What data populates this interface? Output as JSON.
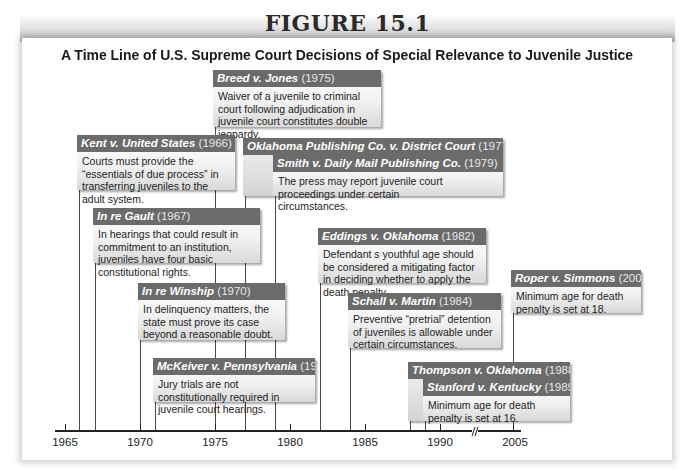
{
  "figure_label": "FIGURE 15.1",
  "title": "A Time Line of U.S. Supreme Court Decisions of Special Relevance to Juvenile Justice",
  "axis": {
    "ticks": [
      "1965",
      "1970",
      "1975",
      "1980",
      "1985",
      "1990",
      "2005"
    ],
    "break_between": [
      "1990",
      "2005"
    ]
  },
  "decisions": [
    {
      "case": "Kent v. United States",
      "year": "(1966)",
      "text": "Courts must provide the “essentials of due process” in transferring juveniles to the adult system."
    },
    {
      "case": "In re Gault",
      "year": "(1967)",
      "text": "In hearings that could result in commitment to an institution, juveniles have four basic constitutional rights."
    },
    {
      "case": "In re Winship",
      "year": "(1970)",
      "text": "In delinquency matters, the state must prove its case beyond a reasonable doubt."
    },
    {
      "case": "McKeiver v. Pennsylvania",
      "year": "(1971)",
      "text": "Jury trials are not constitutionally required in juvenile court hearings."
    },
    {
      "case": "Breed v. Jones",
      "year": "(1975)",
      "text": "Waiver of a juvenile to criminal court following adjudication in juvenile court constitutes double jeopardy."
    },
    {
      "case": "Oklahoma Publishing Co. v. District Court",
      "year": "(1977)",
      "text": ""
    },
    {
      "case": "Smith v. Daily Mail Publishing Co.",
      "year": "(1979)",
      "text": "The press may report juvenile court proceedings under certain circumstances."
    },
    {
      "case": "Eddings v. Oklahoma",
      "year": "(1982)",
      "text": "Defendant s youthful age should be considered a mitigating factor in deciding whether to apply the death penalty."
    },
    {
      "case": "Schall v. Martin",
      "year": "(1984)",
      "text": "Preventive “pretrial” detention of juveniles is allowable under certain circumstances."
    },
    {
      "case": "Thompson v. Oklahoma",
      "year": "(1988)",
      "text": ""
    },
    {
      "case": "Stanford v. Kentucky",
      "year": "(1989)",
      "text": "Minimum age for death penalty is set at 16."
    },
    {
      "case": "Roper v. Simmons",
      "year": "(2005)",
      "text": "Minimum age for death penalty is set at 18."
    }
  ],
  "colors": {
    "header_bg": "#6b6b6b",
    "line": "#4a4a4a",
    "box_gradient_end": "#d9d9d9"
  }
}
